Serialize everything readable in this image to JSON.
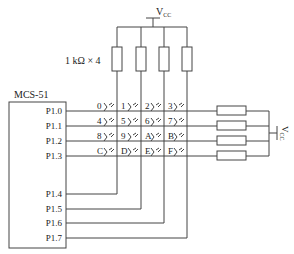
{
  "diagram": {
    "type": "4x4 matrix keypad schematic",
    "chip": {
      "label": "MCS-51",
      "row_pins": [
        "P1.0",
        "P1.1",
        "P1.2",
        "P1.3"
      ],
      "col_pins": [
        "P1.4",
        "P1.5",
        "P1.6",
        "P1.7"
      ]
    },
    "pullup_top": {
      "label": "1 kΩ × 4",
      "supply": "V",
      "supply_sub": "CC"
    },
    "pullup_right": {
      "supply": "V",
      "supply_sub": "CC"
    },
    "keys": [
      [
        "0",
        "1",
        "2",
        "3"
      ],
      [
        "4",
        "5",
        "6",
        "7"
      ],
      [
        "8",
        "9",
        "A",
        "B"
      ],
      [
        "C",
        "D",
        "E",
        "F"
      ]
    ]
  }
}
